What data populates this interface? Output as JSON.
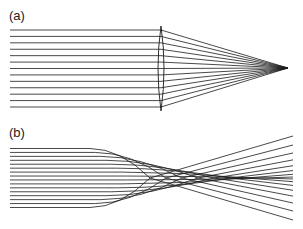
{
  "panels": [
    {
      "label": "(a)",
      "description": "Parallel rays focused by a thin lens to a single focal point"
    },
    {
      "label": "(b)",
      "description": "Parallel rays bent by an aberrating medium, crossing near the axis (caustic)"
    }
  ],
  "diagram": {
    "panel_a": {
      "ray_count": 13,
      "ray_y_top": 30,
      "ray_y_bottom": 107,
      "ray_x_start": 10,
      "lens_x": 161,
      "focus_x": 288,
      "focus_y": 68
    },
    "panel_b": {
      "ray_count": 16,
      "ray_y_top": 149,
      "ray_y_bottom": 208,
      "ray_x_start": 10,
      "axis_y": 178,
      "x_end": 293,
      "end_spread": 84
    },
    "colors": {
      "ray": "#1a1a1a",
      "background": "#ffffff"
    }
  }
}
